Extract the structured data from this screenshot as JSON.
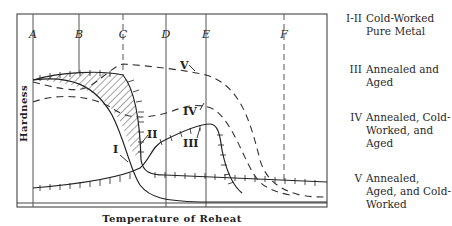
{
  "figure": {
    "type": "hardness-vs-reheat-temperature schematic",
    "axes": {
      "ylabel": "Hardness",
      "xlabel": "Temperature of Reheat"
    },
    "reference_temperatures": [
      {
        "label": "A",
        "style": "solid"
      },
      {
        "label": "B",
        "style": "solid"
      },
      {
        "label": "C",
        "style": "dashed"
      },
      {
        "label": "D",
        "style": "solid"
      },
      {
        "label": "E",
        "style": "solid"
      },
      {
        "label": "F",
        "style": "dashed"
      }
    ],
    "curves": [
      {
        "id": "I",
        "label": "I",
        "style": "solid"
      },
      {
        "id": "II",
        "label": "II",
        "style": "ticked"
      },
      {
        "id": "III",
        "label": "III",
        "style": "ticked"
      },
      {
        "id": "IV",
        "label": "IV",
        "style": "dashed"
      },
      {
        "id": "V",
        "label": "V",
        "style": "dashed"
      }
    ],
    "shaded_region": "hatched area between curves I and II"
  },
  "legend": [
    {
      "key": "I-II",
      "text": "Cold-Worked Pure Metal"
    },
    {
      "key": "III",
      "text": "Annealed and Aged"
    },
    {
      "key": "IV",
      "text": "Annealed, Cold-Worked, and Aged"
    },
    {
      "key": "V",
      "text": "Annealed, Aged, and Cold-Worked"
    }
  ]
}
